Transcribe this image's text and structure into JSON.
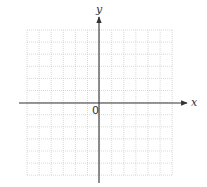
{
  "diagram": {
    "type": "coordinate-grid",
    "grid": {
      "columns": 12,
      "rows": 12,
      "left": 27,
      "top": 30,
      "cell": 12.1,
      "line_color": "#cfcfcf",
      "line_style": "dotted"
    },
    "axes": {
      "color": "#333333",
      "x_axis": {
        "label": "x",
        "y": 103,
        "from": 19,
        "to": 187
      },
      "y_axis": {
        "label": "y",
        "x": 99,
        "from": 183,
        "to": 17
      },
      "origin_label": "0"
    }
  }
}
